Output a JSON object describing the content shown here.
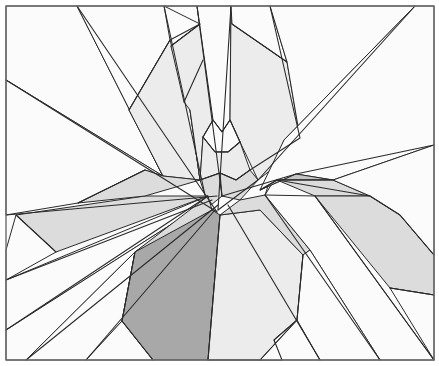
{
  "diagram": {
    "title": "",
    "frame": {
      "x": 6,
      "y": 6,
      "width": 428,
      "height": 354,
      "stroke": "#6e6e6e"
    },
    "colors": {
      "white": "#fbfbfb",
      "very_light": "#ececec",
      "light": "#dcdcdc",
      "medium": "#c4c4c4",
      "dark": "#a8a8a8",
      "line": "#2a2a2a"
    },
    "polygons": [
      {
        "name": "left-upper-wedge",
        "fill": "white",
        "points": "6,6 77,6 163,176 6,80"
      },
      {
        "name": "top-left-wedge",
        "fill": "white",
        "points": "77,6 164,6 170,40 129,110 163,176"
      },
      {
        "name": "left-mid-wedge",
        "fill": "white",
        "points": "6,80 163,176 145,170 78,203 6,215"
      },
      {
        "name": "upper-left-light-band",
        "fill": "very_light",
        "points": "129,110 170,40 190,110 200,180 163,176"
      },
      {
        "name": "top-narrow-strip",
        "fill": "white",
        "points": "164,6 197,6 213,120 200,180 190,110 171,46 200,24"
      },
      {
        "name": "top-center-strip",
        "fill": "very_light",
        "points": "171,46 200,24 213,120 203,137 200,180 190,110 184,102"
      },
      {
        "name": "top-center-column",
        "fill": "white",
        "points": "197,6 231,6 230,120 222,132 213,120"
      },
      {
        "name": "top-right-column",
        "fill": "very_light",
        "points": "231,6 232,24 287,62 300,138 290,155 258,180 240,142 230,120"
      },
      {
        "name": "top-right-strip",
        "fill": "white",
        "points": "231,6 270,6 287,62 232,24"
      },
      {
        "name": "top-right-large",
        "fill": "white",
        "points": "270,6 415,6 284,140 265,195 300,138 287,62"
      },
      {
        "name": "right-upper-wedge",
        "fill": "white",
        "points": "415,6 434,6 434,145 333,180 296,174 260,190 284,140"
      },
      {
        "name": "center-diamond-top",
        "fill": "white",
        "points": "213,120 222,132 230,120 240,142 228,152 215,152 203,137"
      },
      {
        "name": "center-diamond-mid",
        "fill": "very_light",
        "points": "203,137 215,152 228,152 240,142 250,170 236,180 220,173 200,180"
      },
      {
        "name": "center-small-left",
        "fill": "light",
        "points": "200,180 220,173 222,196 211,205 205,195"
      },
      {
        "name": "center-small-right",
        "fill": "light",
        "points": "220,173 236,180 250,170 258,180 240,200 222,196"
      },
      {
        "name": "dark-wedge-right",
        "fill": "medium",
        "points": "260,190 296,174 333,180 277,180"
      },
      {
        "name": "right-light-band-top",
        "fill": "light",
        "points": "277,180 333,180 370,196 315,196"
      },
      {
        "name": "left-light-trapezoid",
        "fill": "light",
        "points": "16,215 145,196 208,196 56,252"
      },
      {
        "name": "left-upper-light",
        "fill": "light",
        "points": "78,203 145,170 163,176 200,180 145,196"
      },
      {
        "name": "left-lower-white",
        "fill": "white",
        "points": "6,250 16,215 56,252 6,280"
      },
      {
        "name": "left-lower-band",
        "fill": "white",
        "points": "6,280 208,196 186,215 6,330"
      },
      {
        "name": "left-bottom-band",
        "fill": "white",
        "points": "6,330 186,215 135,252 26,360 6,360"
      },
      {
        "name": "left-bottom-band-2",
        "fill": "white",
        "points": "26,360 135,252 122,321 86,360"
      },
      {
        "name": "bottom-left-white",
        "fill": "white",
        "points": "86,360 122,321 153,360"
      },
      {
        "name": "center-left-light",
        "fill": "light",
        "points": "135,252 208,196 212,210 122,321"
      },
      {
        "name": "dark-hexagon",
        "fill": "dark",
        "points": "212,210 220,215 208,360 153,360 122,321 135,252"
      },
      {
        "name": "center-tall-light",
        "fill": "very_light",
        "points": "220,215 260,210 303,255 297,320 274,340 282,360 208,360"
      },
      {
        "name": "bottom-center-white",
        "fill": "white",
        "points": "260,360 297,320 320,360"
      },
      {
        "name": "center-right-light",
        "fill": "light",
        "points": "220,215 240,200 265,195 310,250 303,255 260,210"
      },
      {
        "name": "right-middle-white",
        "fill": "white",
        "points": "265,195 315,196 434,360 380,360 310,250"
      },
      {
        "name": "right-diagonal-band",
        "fill": "white",
        "points": "310,250 380,360 320,360 297,320 303,255"
      },
      {
        "name": "right-light-band",
        "fill": "light",
        "points": "315,196 370,196 400,215 434,255 434,295 390,288"
      },
      {
        "name": "right-lower-white",
        "fill": "white",
        "points": "390,288 434,295 434,360"
      },
      {
        "name": "right-edge-white",
        "fill": "white",
        "points": "333,180 434,145 434,255 400,215 370,196"
      }
    ],
    "lines": [
      {
        "name": "ray-1",
        "points": "77,6 217,212"
      },
      {
        "name": "ray-2",
        "points": "6,80 217,212"
      },
      {
        "name": "ray-3",
        "points": "164,6 205,195"
      },
      {
        "name": "ray-4",
        "points": "197,6 222,196"
      },
      {
        "name": "ray-5",
        "points": "231,6 218,210"
      },
      {
        "name": "ray-6",
        "points": "270,6 300,138 250,170"
      },
      {
        "name": "ray-7",
        "points": "415,6 258,180 218,210"
      },
      {
        "name": "ray-8",
        "points": "434,145 296,174 222,196"
      },
      {
        "name": "ray-9",
        "points": "6,215 217,196"
      },
      {
        "name": "ray-10",
        "points": "6,280 212,200"
      },
      {
        "name": "ray-11",
        "points": "6,330 208,196"
      },
      {
        "name": "ray-12",
        "points": "26,360 218,205"
      },
      {
        "name": "ray-13",
        "points": "86,360 215,210"
      },
      {
        "name": "ray-14",
        "points": "208,360 220,215"
      },
      {
        "name": "ray-15",
        "points": "265,195 380,360"
      },
      {
        "name": "ray-16",
        "points": "228,205 320,360"
      },
      {
        "name": "ray-17",
        "points": "315,196 434,360"
      },
      {
        "name": "sub-1",
        "points": "129,110 170,40 200,24"
      },
      {
        "name": "sub-2",
        "points": "171,46 200,24"
      },
      {
        "name": "sub-3",
        "points": "184,102 203,60"
      },
      {
        "name": "sub-4",
        "points": "232,24 287,62"
      },
      {
        "name": "sub-5",
        "points": "203,137 213,120 222,132 230,120 240,142"
      },
      {
        "name": "sub-6",
        "points": "203,137 215,152 228,152 240,142"
      },
      {
        "name": "sub-7",
        "points": "200,180 220,173 236,180 250,170"
      },
      {
        "name": "sub-8",
        "points": "16,215 56,252"
      },
      {
        "name": "sub-9",
        "points": "78,203 145,170"
      },
      {
        "name": "sub-10",
        "points": "135,252 122,321 153,360"
      },
      {
        "name": "sub-11",
        "points": "260,190 277,180 333,180"
      },
      {
        "name": "sub-12",
        "points": "277,180 370,196 400,215 434,255"
      },
      {
        "name": "sub-13",
        "points": "390,288 434,295"
      },
      {
        "name": "sub-14",
        "points": "303,255 297,320 274,340 282,360"
      },
      {
        "name": "sub-15",
        "points": "297,320 260,360"
      },
      {
        "name": "sub-16",
        "points": "208,360 260,360"
      }
    ]
  }
}
